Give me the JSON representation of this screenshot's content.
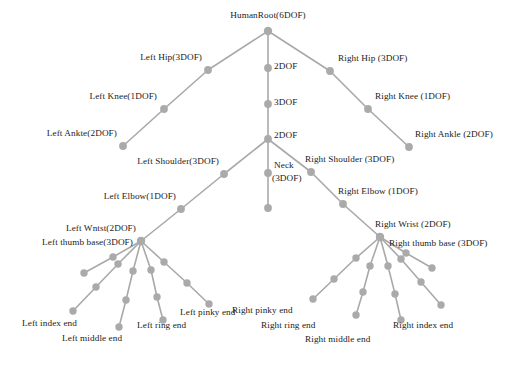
{
  "figure": {
    "node_color": "#aaaaaa",
    "edge_color": "#a9a9a9",
    "background_color": "#ffffff",
    "width": 518,
    "height": 369
  },
  "labels": {
    "root": "HumanRoot(6DOF)",
    "spine_2dof_upper": "2DOF",
    "spine_3dof": "3DOF",
    "spine_2dof_lower": "2DOF",
    "neck": "Neck",
    "neck_dof": "(3DOF)",
    "left_hip": "Left Hip(3DOF)",
    "left_knee": "Left Knee(1DOF)",
    "left_ankle": "Left Ankte(2DOF)",
    "right_hip": "Right Hip (3DOF)",
    "right_knee": "Right Knee (1DOF)",
    "right_ankle": "Right Ankle (2DOF)",
    "left_shoulder": "Left Shoulder(3DOF)",
    "left_elbow": "Left Elbow(1DOF)",
    "left_wrist": "Left Wntst(2DOF)",
    "left_thumb_base": "Left thumb base(3DOF)",
    "right_shoulder": "Right Shoulder (3DOF)",
    "right_elbow": "Right Elbow (1DOF)",
    "right_wrist": "Right Wrist (2DOF)",
    "right_thumb_base": "Right thumb base (3DOF)",
    "left_index_end": "Left index end",
    "left_middle_end": "Left middle end",
    "left_ring_end": "Left ring end",
    "left_pinky_end": "Left pinky end",
    "right_index_end": "Right index end",
    "right_middle_end": "Right middle end",
    "right_ring_end": "Right ring end",
    "right_pinky_end": "Right pinky end"
  },
  "chart_data": {
    "type": "diagram",
    "subtype": "tree-hierarchy",
    "total_dof": 6,
    "nodes": [
      {
        "id": "root",
        "label": "HumanRoot(6DOF)",
        "dof": 6,
        "x": 268,
        "y": 31
      },
      {
        "id": "spine1",
        "label": "2DOF",
        "dof": 2,
        "x": 268,
        "y": 68
      },
      {
        "id": "spine2",
        "label": "3DOF",
        "dof": 3,
        "x": 268,
        "y": 104
      },
      {
        "id": "spine3",
        "label": "2DOF",
        "dof": 2,
        "x": 268,
        "y": 139
      },
      {
        "id": "neck",
        "label": "Neck (3DOF)",
        "dof": 3,
        "x": 268,
        "y": 173
      },
      {
        "id": "head",
        "label": "",
        "dof": 0,
        "x": 268,
        "y": 208
      },
      {
        "id": "lhip",
        "label": "Left Hip(3DOF)",
        "dof": 3,
        "x": 208,
        "y": 70
      },
      {
        "id": "lknee",
        "label": "Left Knee(1DOF)",
        "dof": 1,
        "x": 164,
        "y": 109
      },
      {
        "id": "lankle",
        "label": "Left Ankte(2DOF)",
        "dof": 2,
        "x": 123,
        "y": 146
      },
      {
        "id": "rhip",
        "label": "Right Hip (3DOF)",
        "dof": 3,
        "x": 330,
        "y": 71
      },
      {
        "id": "rknee",
        "label": "Right Knee (1DOF)",
        "dof": 1,
        "x": 368,
        "y": 109
      },
      {
        "id": "rankle",
        "label": "Right Ankle (2DOF)",
        "dof": 2,
        "x": 409,
        "y": 147
      },
      {
        "id": "lshoulder",
        "label": "Left Shoulder(3DOF)",
        "dof": 3,
        "x": 224,
        "y": 174
      },
      {
        "id": "lelbow",
        "label": "Left Elbow(1DOF)",
        "dof": 1,
        "x": 181,
        "y": 209
      },
      {
        "id": "lwrist",
        "label": "Left Wntst(2DOF)",
        "dof": 2,
        "x": 141,
        "y": 241
      },
      {
        "id": "rshoulder",
        "label": "Right Shoulder (3DOF)",
        "dof": 3,
        "x": 311,
        "y": 172
      },
      {
        "id": "relbow",
        "label": "Right Elbow (1DOF)",
        "dof": 1,
        "x": 343,
        "y": 204
      },
      {
        "id": "rwrist",
        "label": "Right Wrist (2DOF)",
        "dof": 2,
        "x": 380,
        "y": 237
      }
    ],
    "edges": [
      [
        "root",
        "spine1"
      ],
      [
        "spine1",
        "spine2"
      ],
      [
        "spine2",
        "spine3"
      ],
      [
        "spine3",
        "neck"
      ],
      [
        "neck",
        "head"
      ],
      [
        "root",
        "lhip"
      ],
      [
        "lhip",
        "lknee"
      ],
      [
        "lknee",
        "lankle"
      ],
      [
        "root",
        "rhip"
      ],
      [
        "rhip",
        "rknee"
      ],
      [
        "rknee",
        "rankle"
      ],
      [
        "spine3",
        "lshoulder"
      ],
      [
        "lshoulder",
        "lelbow"
      ],
      [
        "lelbow",
        "lwrist"
      ],
      [
        "spine3",
        "rshoulder"
      ],
      [
        "rshoulder",
        "relbow"
      ],
      [
        "relbow",
        "rwrist"
      ]
    ],
    "left_hand": {
      "wrist": {
        "x": 141,
        "y": 241
      },
      "fingers": [
        {
          "name": "thumb",
          "label": "Left thumb base(3DOF)",
          "dof": 3,
          "joints": [
            [
              113,
              257
            ],
            [
              84,
              273
            ]
          ]
        },
        {
          "name": "index",
          "label": "Left index end",
          "joints": [
            [
              118,
              264
            ],
            [
              96,
              287
            ],
            [
              73,
              311
            ]
          ]
        },
        {
          "name": "middle",
          "label": "Left middle end",
          "joints": [
            [
              133,
              271
            ],
            [
              126,
              300
            ],
            [
              119,
              327
            ]
          ]
        },
        {
          "name": "ring",
          "label": "Left ring end",
          "joints": [
            [
              151,
              270
            ],
            [
              157,
              297
            ],
            [
              163,
              320
            ]
          ]
        },
        {
          "name": "pinky",
          "label": "Left pinky end",
          "joints": [
            [
              164,
              262
            ],
            [
              187,
              283
            ],
            [
              209,
              304
            ]
          ]
        }
      ]
    },
    "right_hand": {
      "wrist": {
        "x": 380,
        "y": 237
      },
      "fingers": [
        {
          "name": "thumb",
          "label": "Right thumb base (3DOF)",
          "dof": 3,
          "joints": [
            [
              406,
              253
            ],
            [
              432,
              268
            ]
          ]
        },
        {
          "name": "index",
          "label": "Right index end",
          "joints": [
            [
              401,
              259
            ],
            [
              421,
              282
            ],
            [
              441,
              305
            ]
          ]
        },
        {
          "name": "middle",
          "label": "Right middle end",
          "joints": [
            [
              388,
              266
            ],
            [
              395,
              294
            ],
            [
              401,
              320
            ]
          ]
        },
        {
          "name": "ring",
          "label": "Right ring end",
          "joints": [
            [
              370,
              266
            ],
            [
              363,
              292
            ],
            [
              356,
              315
            ]
          ]
        },
        {
          "name": "pinky",
          "label": "Right pinky end",
          "joints": [
            [
              356,
              258
            ],
            [
              334,
              279
            ],
            [
              313,
              299
            ]
          ]
        }
      ]
    }
  }
}
